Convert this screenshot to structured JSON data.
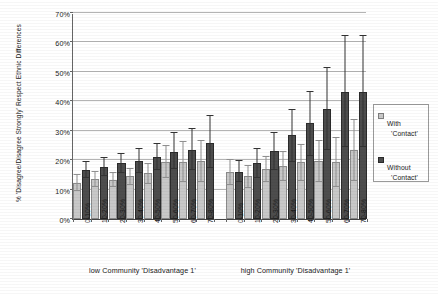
{
  "chart_data": {
    "type": "bar",
    "title": "",
    "xlabel": "",
    "ylabel": "% 'Disagree/Disagree Strongly' Respect Ethnic Differences",
    "ylim": [
      0,
      70
    ],
    "yticks": [
      "0%",
      "10%",
      "20%",
      "30%",
      "40%",
      "50%",
      "60%",
      "70%"
    ],
    "ytick_values": [
      0,
      10,
      20,
      30,
      40,
      50,
      60,
      70
    ],
    "grid": true,
    "legend_position": "right",
    "categories": [
      "0-10%",
      "10-20%",
      "20-30%",
      "30-40%",
      "40-50%",
      "50-60%",
      "60-70%",
      "70-80%"
    ],
    "groups": [
      {
        "label": "low Community 'Disadvantage 1'"
      },
      {
        "label": "high Community 'Disadvantage 1'"
      }
    ],
    "series": [
      {
        "name": "With 'Contact'",
        "color": "#c8c8c8",
        "groups": [
          {
            "group": "low Community 'Disadvantage 1'",
            "values": [
              12.3,
              13.5,
              13.3,
              14.5,
              15.5,
              19.5,
              19.5,
              19.8
            ],
            "err_low": [
              9.5,
              11.0,
              10.8,
              11.5,
              12.0,
              14.0,
              12.5,
              12.5
            ],
            "err_high": [
              15.3,
              16.2,
              16.0,
              17.5,
              19.0,
              25.0,
              26.5,
              27.0
            ]
          },
          {
            "group": "high Community 'Disadvantage 1'",
            "values": [
              16.0,
              14.5,
              17.0,
              18.0,
              19.3,
              19.8,
              19.5,
              23.5
            ],
            "err_low": [
              11.5,
              10.5,
              12.5,
              13.0,
              13.0,
              12.5,
              11.0,
              13.0
            ],
            "err_high": [
              20.5,
              18.5,
              21.5,
              23.0,
              25.5,
              27.0,
              28.0,
              34.0
            ]
          }
        ]
      },
      {
        "name": "Without 'Contact'",
        "color": "#4d4d4d",
        "groups": [
          {
            "group": "low Community 'Disadvantage 1'",
            "values": [
              16.8,
              17.8,
              19.0,
              19.8,
              21.0,
              22.8,
              23.3,
              26.0
            ],
            "err_low": [
              13.8,
              14.5,
              15.5,
              15.8,
              16.5,
              17.0,
              16.5,
              17.5
            ],
            "err_high": [
              19.8,
              21.0,
              22.5,
              24.0,
              26.0,
              29.5,
              31.0,
              35.5
            ]
          },
          {
            "group": "high Community 'Disadvantage 1'",
            "values": [
              16.0,
              19.0,
              23.0,
              28.5,
              32.5,
              37.5,
              43.0,
              43.0
            ],
            "err_low": [
              12.5,
              14.0,
              16.5,
              19.5,
              21.5,
              23.5,
              24.5,
              24.5
            ],
            "err_high": [
              20.0,
              24.0,
              29.5,
              37.5,
              43.5,
              51.5,
              62.5,
              62.5
            ]
          }
        ]
      }
    ]
  },
  "legend": {
    "items": [
      {
        "line1": "With",
        "line2": "'Contact'",
        "swatch": "with"
      },
      {
        "line1": "Without",
        "line2": "'Contact'",
        "swatch": "without"
      }
    ]
  },
  "colors": {
    "with_contact": "#c8c8c8",
    "without_contact": "#4d4d4d",
    "grid": "#b4b4b4",
    "axis": "#444444",
    "text": "#1a1a1a"
  }
}
